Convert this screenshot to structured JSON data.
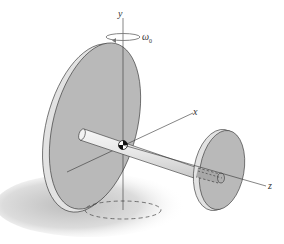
{
  "figure": {
    "axes": {
      "y_label": "y",
      "x_label": "x",
      "z_label": "z"
    },
    "angular_velocity": {
      "symbol": "ω",
      "subscript": "0"
    },
    "colors": {
      "disk_face": "#b9b9b9",
      "disk_rim": "#e2e2e2",
      "shaft": "#ebebeb",
      "outline": "#333333",
      "shadow": "#cfcfcf",
      "axis_line": "#333333"
    }
  }
}
